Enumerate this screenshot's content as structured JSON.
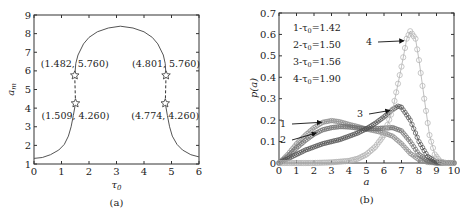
{
  "chart_data": [
    {
      "type": "line",
      "caption": "(a)",
      "xlabel": "τ0",
      "ylabel": "a_m",
      "xlim": [
        0,
        6
      ],
      "ylim": [
        1,
        9
      ],
      "xticks": [
        "0",
        "1",
        "2",
        "3",
        "4",
        "5",
        "6"
      ],
      "yticks": [
        "1",
        "2",
        "3",
        "4",
        "5",
        "6",
        "7",
        "8",
        "9"
      ],
      "grid": false,
      "series": [
        {
          "name": "a_m vs tau0",
          "points": [
            [
              0,
              1.3
            ],
            [
              0.3,
              1.35
            ],
            [
              0.6,
              1.5
            ],
            [
              0.9,
              1.75
            ],
            [
              1.1,
              2.05
            ],
            [
              1.25,
              2.5
            ],
            [
              1.35,
              3.0
            ],
            [
              1.43,
              3.6
            ],
            [
              1.509,
              4.26
            ],
            [
              1.482,
              5.76
            ],
            [
              1.52,
              6.4
            ],
            [
              1.6,
              6.85
            ],
            [
              1.8,
              7.45
            ],
            [
              2.0,
              7.8
            ],
            [
              2.3,
              8.1
            ],
            [
              2.7,
              8.3
            ],
            [
              3.14,
              8.4
            ],
            [
              3.6,
              8.3
            ],
            [
              4.0,
              8.1
            ],
            [
              4.3,
              7.8
            ],
            [
              4.5,
              7.45
            ],
            [
              4.7,
              6.85
            ],
            [
              4.77,
              6.4
            ],
            [
              4.801,
              5.76
            ],
            [
              4.774,
              4.26
            ],
            [
              4.85,
              3.6
            ],
            [
              4.93,
              3.0
            ],
            [
              5.03,
              2.5
            ],
            [
              5.2,
              2.05
            ],
            [
              5.4,
              1.75
            ],
            [
              5.7,
              1.5
            ],
            [
              6.0,
              1.38
            ]
          ]
        }
      ],
      "annotations": [
        {
          "text": "(1.482, 5.760)",
          "x": 1.482,
          "y": 5.76
        },
        {
          "text": "(1.509, 4.260)",
          "x": 1.509,
          "y": 4.26
        },
        {
          "text": "(4.801, 5.760)",
          "x": 4.801,
          "y": 5.76
        },
        {
          "text": "(4.774, 4.260)",
          "x": 4.774,
          "y": 4.26
        }
      ]
    },
    {
      "type": "line",
      "caption": "(b)",
      "xlabel": "a",
      "ylabel": "p(a)",
      "xlim": [
        0,
        10
      ],
      "ylim": [
        0,
        0.7
      ],
      "xticks": [
        "0",
        "1",
        "2",
        "3",
        "4",
        "5",
        "6",
        "7",
        "8",
        "9",
        "10"
      ],
      "yticks": [
        "0",
        "0.1",
        "0.2",
        "0.3",
        "0.4",
        "0.5",
        "0.6",
        "0.7"
      ],
      "grid": false,
      "legend": [
        "1-τ0=1.42",
        "2-τ0=1.50",
        "3-τ0=1.56",
        "4-τ0=1.90"
      ],
      "legend_position": "top-left",
      "series": [
        {
          "name": "1-τ0=1.42",
          "label": "1",
          "values": [
            [
              0,
              0
            ],
            [
              0.5,
              0.04
            ],
            [
              1,
              0.09
            ],
            [
              1.5,
              0.13
            ],
            [
              2,
              0.165
            ],
            [
              2.5,
              0.19
            ],
            [
              3,
              0.198
            ],
            [
              3.5,
              0.192
            ],
            [
              4,
              0.18
            ],
            [
              4.5,
              0.17
            ],
            [
              5,
              0.158
            ],
            [
              5.5,
              0.15
            ],
            [
              6,
              0.14
            ],
            [
              6.5,
              0.125
            ],
            [
              7,
              0.09
            ],
            [
              7.5,
              0.045
            ],
            [
              8,
              0.015
            ],
            [
              8.5,
              0.003
            ],
            [
              9,
              0
            ],
            [
              10,
              0
            ]
          ]
        },
        {
          "name": "2-τ0=1.50",
          "label": "2",
          "values": [
            [
              0,
              0
            ],
            [
              0.5,
              0.03
            ],
            [
              1,
              0.07
            ],
            [
              1.5,
              0.105
            ],
            [
              2,
              0.135
            ],
            [
              2.5,
              0.155
            ],
            [
              3,
              0.165
            ],
            [
              3.5,
              0.17
            ],
            [
              4,
              0.168
            ],
            [
              4.5,
              0.163
            ],
            [
              5,
              0.16
            ],
            [
              5.5,
              0.16
            ],
            [
              6,
              0.163
            ],
            [
              6.5,
              0.165
            ],
            [
              7,
              0.15
            ],
            [
              7.5,
              0.1
            ],
            [
              8,
              0.04
            ],
            [
              8.5,
              0.01
            ],
            [
              9,
              0
            ],
            [
              10,
              0
            ]
          ]
        },
        {
          "name": "3-τ0=1.56",
          "label": "3",
          "values": [
            [
              0,
              0
            ],
            [
              0.5,
              0.02
            ],
            [
              1,
              0.04
            ],
            [
              1.5,
              0.06
            ],
            [
              2,
              0.075
            ],
            [
              2.5,
              0.09
            ],
            [
              3,
              0.1
            ],
            [
              3.5,
              0.11
            ],
            [
              4,
              0.125
            ],
            [
              4.5,
              0.14
            ],
            [
              5,
              0.16
            ],
            [
              5.5,
              0.185
            ],
            [
              6,
              0.215
            ],
            [
              6.5,
              0.25
            ],
            [
              6.8,
              0.265
            ],
            [
              7,
              0.26
            ],
            [
              7.5,
              0.2
            ],
            [
              8,
              0.1
            ],
            [
              8.5,
              0.03
            ],
            [
              9,
              0.005
            ],
            [
              10,
              0
            ]
          ]
        },
        {
          "name": "4-τ0=1.90",
          "label": "4",
          "values": [
            [
              0,
              0
            ],
            [
              1,
              0
            ],
            [
              2,
              0
            ],
            [
              3,
              0.003
            ],
            [
              4,
              0.01
            ],
            [
              4.5,
              0.02
            ],
            [
              5,
              0.04
            ],
            [
              5.5,
              0.075
            ],
            [
              6,
              0.13
            ],
            [
              6.5,
              0.25
            ],
            [
              7,
              0.45
            ],
            [
              7.3,
              0.58
            ],
            [
              7.5,
              0.615
            ],
            [
              7.8,
              0.58
            ],
            [
              8,
              0.48
            ],
            [
              8.3,
              0.3
            ],
            [
              8.6,
              0.13
            ],
            [
              8.9,
              0.04
            ],
            [
              9.2,
              0.008
            ],
            [
              9.5,
              0
            ],
            [
              10,
              0
            ]
          ]
        }
      ],
      "arrow_labels": [
        {
          "text": "1",
          "points_to": [
            2.6,
            0.19
          ]
        },
        {
          "text": "2",
          "points_to": [
            2.3,
            0.14
          ]
        },
        {
          "text": "3",
          "points_to": [
            6.5,
            0.245
          ]
        },
        {
          "text": "4",
          "points_to": [
            7.3,
            0.57
          ]
        }
      ]
    }
  ]
}
